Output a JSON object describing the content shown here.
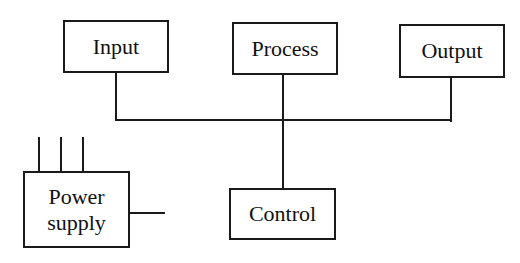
{
  "diagram": {
    "type": "block-diagram",
    "blocks": [
      {
        "id": "input",
        "label": "Input"
      },
      {
        "id": "process",
        "label": "Process"
      },
      {
        "id": "output",
        "label": "Output"
      },
      {
        "id": "control",
        "label": "Control"
      },
      {
        "id": "power",
        "label_line1": "Power",
        "label_line2": "supply"
      }
    ],
    "connections": [
      {
        "from": "input",
        "to": "bus"
      },
      {
        "from": "process",
        "to": "bus"
      },
      {
        "from": "output",
        "to": "bus"
      },
      {
        "from": "bus",
        "to": "control"
      },
      {
        "from": "power",
        "to": "external",
        "note": "three input pins on top, one output lead on right"
      }
    ],
    "colors": {
      "line": "#1a1a1a",
      "background": "#ffffff"
    }
  }
}
